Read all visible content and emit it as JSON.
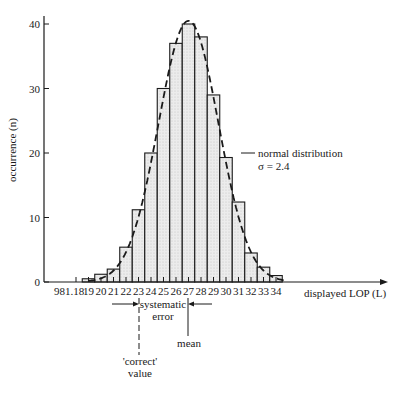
{
  "chart_data": {
    "type": "bar",
    "title": "",
    "xlabel": "displayed LOP (L)",
    "ylabel": "occurrence (n)",
    "ylim": [
      0,
      40
    ],
    "yticks": [
      0,
      10,
      20,
      30,
      40
    ],
    "first_tick_label": "981.18",
    "categories": [
      18,
      19,
      20,
      21,
      22,
      23,
      24,
      25,
      26,
      27,
      28,
      29,
      30,
      31,
      32,
      33,
      34
    ],
    "tick_labels": [
      "981.18",
      "19",
      "20",
      "21",
      "22",
      "23",
      "24",
      "25",
      "26",
      "27",
      "28",
      "29",
      "30",
      "31",
      "32",
      "33",
      "34"
    ],
    "values": [
      0,
      0.5,
      1.2,
      2,
      5.4,
      11.2,
      20,
      30,
      37,
      40,
      38,
      29,
      19.3,
      12.4,
      4.5,
      2.3,
      1
    ],
    "series": [
      {
        "name": "histogram",
        "values": [
          0,
          0.5,
          1.2,
          2,
          5.4,
          11.2,
          20,
          30,
          37,
          40,
          38,
          29,
          19.3,
          12.4,
          4.5,
          2.3,
          1
        ]
      },
      {
        "name": "normal distribution",
        "style": "dashed",
        "mean": 27,
        "sigma": 2.4,
        "peak": 40.5
      }
    ],
    "grid": false,
    "legend": "none",
    "annotations": [
      {
        "text": "normal distribution",
        "line2": "σ = 2.4",
        "target": "dashed curve"
      },
      {
        "text": "systematic",
        "line2": "error",
        "between": [
          "correct value",
          "mean"
        ]
      },
      {
        "text": "'correct'",
        "line2": "value",
        "x": 23
      },
      {
        "text": "mean",
        "x": 27
      }
    ]
  },
  "labels": {
    "ylabel": "occurrence (n)",
    "xlabel": "displayed LOP (L)",
    "normal_line1": "normal distribution",
    "normal_line2": "σ = 2.4",
    "syst_line1": "systematic",
    "syst_line2": "error",
    "correct_line1": "'correct'",
    "correct_line2": "value",
    "mean": "mean"
  },
  "colors": {
    "ink": "#1a1a1a",
    "bar_fill": "#e4e4e4",
    "background": "#ffffff"
  }
}
